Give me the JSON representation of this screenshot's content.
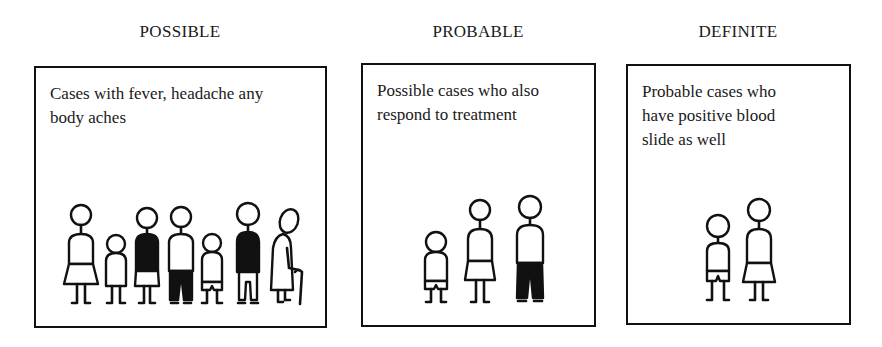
{
  "panels": [
    {
      "heading": "POSSIBLE",
      "description_lines": [
        "Cases with fever, headache any",
        "body aches"
      ],
      "figures": [
        "woman-skirt",
        "child",
        "woman-dark-top",
        "man-dark-trousers",
        "child",
        "man-dark-top",
        "elderly-with-cane"
      ]
    },
    {
      "heading": "PROBABLE",
      "description_lines": [
        "Possible cases who also",
        "respond to treatment"
      ],
      "figures": [
        "child",
        "woman-skirt",
        "man-dark-trousers"
      ]
    },
    {
      "heading": "DEFINITE",
      "description_lines": [
        "Probable cases who",
        "have positive blood",
        "slide as well"
      ],
      "figures": [
        "child",
        "woman-skirt"
      ]
    }
  ]
}
